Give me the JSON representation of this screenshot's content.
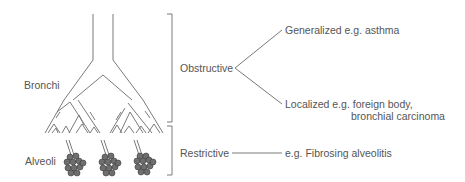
{
  "diagram": {
    "anatomy_labels": {
      "bronchi": "Bronchi",
      "alveoli": "Alveoli"
    },
    "categories": [
      {
        "name": "Obstructive",
        "region": "Bronchi",
        "subtypes": [
          {
            "label": "Generalized e.g. asthma"
          },
          {
            "label_line1": "Localized e.g. foreign body,",
            "label_line2": "bronchial carcinoma"
          }
        ]
      },
      {
        "name": "Restrictive",
        "region": "Alveoli",
        "subtypes": [
          {
            "label": "e.g. Fibrosing alveolitis"
          }
        ]
      }
    ],
    "colors": {
      "line": "#7a7a7a",
      "text": "#555555",
      "alveoli_fill": "#6e6e6e"
    }
  }
}
